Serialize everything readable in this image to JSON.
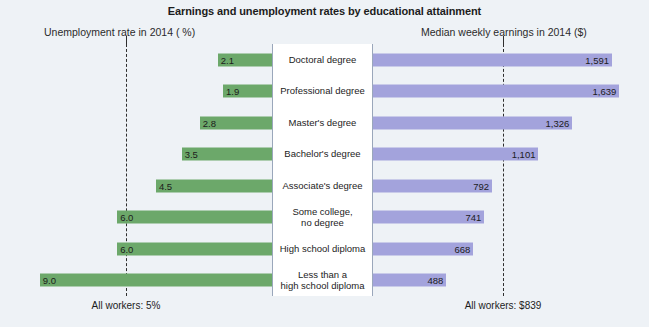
{
  "chart_data": {
    "type": "bar",
    "title": "Earnings and unemployment rates by educational attainment",
    "orientation": "horizontal-diverging",
    "categories": [
      "Doctoral degree",
      "Professional degree",
      "Master's degree",
      "Bachelor's degree",
      "Associate's degree",
      "Some college,\nno degree",
      "High school diploma",
      "Less than a\nhigh school diploma"
    ],
    "series": [
      {
        "name": "Unemployment rate in 2014 ( %)",
        "side": "left",
        "unit": "%",
        "color": "#6ca86a",
        "values": [
          2.1,
          1.9,
          2.8,
          3.5,
          4.5,
          6.0,
          6.0,
          9.0
        ],
        "labels": [
          "2.1",
          "1.9",
          "2.8",
          "3.5",
          "4.5",
          "6.0",
          "6.0",
          "9.0"
        ],
        "reference_value": 5,
        "reference_label": "All workers: 5%",
        "axis_max": 10
      },
      {
        "name": "Median weekly earnings in 2014 ($)",
        "side": "right",
        "unit": "$",
        "color": "#a3a3dc",
        "values": [
          1591,
          1639,
          1326,
          1101,
          792,
          741,
          668,
          488
        ],
        "labels": [
          "1,591",
          "1,639",
          "1,326",
          "1,101",
          "792",
          "741",
          "668",
          "488"
        ],
        "reference_value": 839,
        "reference_label": "All workers: $839",
        "axis_max": 1750
      }
    ],
    "xlabel": "",
    "ylabel": "",
    "grid": false,
    "legend": "none"
  },
  "header": {
    "title": "Earnings and unemployment rates by educational attainment",
    "left_axis_label": "Unemployment rate in 2014 ( %)",
    "right_axis_label": "Median weekly earnings in 2014 ($)"
  },
  "footer": {
    "left_note": "All workers: 5%",
    "right_note": "All workers: $839"
  }
}
